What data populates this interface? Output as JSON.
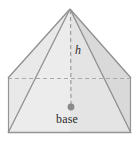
{
  "figure": {
    "kind": "geometry-diagram",
    "canvas": {
      "width": 139,
      "height": 143,
      "background": "#ffffff"
    },
    "labels": {
      "height": "h",
      "base": "base"
    },
    "colors": {
      "outline": "#8f8f8f",
      "hidden_edge": "#a9a9a9",
      "face_front_left": "#ececec",
      "face_front_right": "#e2e2e2",
      "face_right_shaded": "#d8d8d8",
      "base_face": "#ebebeb",
      "center_dot": "#8a8a8a",
      "label_text": "#2b2b2b"
    },
    "points": {
      "apex": {
        "x": 70,
        "y": 9
      },
      "base_back_left": {
        "x": 8,
        "y": 78
      },
      "base_back_right": {
        "x": 131,
        "y": 78
      },
      "base_front_right": {
        "x": 131,
        "y": 133
      },
      "base_front_left": {
        "x": 8,
        "y": 133
      },
      "base_center": {
        "x": 71,
        "y": 107
      }
    },
    "edges": [
      {
        "name": "apex-to-back-left",
        "style": "solid"
      },
      {
        "name": "apex-to-back-right",
        "style": "solid"
      },
      {
        "name": "apex-to-front-left",
        "style": "solid"
      },
      {
        "name": "apex-to-front-right",
        "style": "solid"
      },
      {
        "name": "base-back",
        "style": "dashed"
      },
      {
        "name": "base-left",
        "style": "solid"
      },
      {
        "name": "base-right",
        "style": "solid"
      },
      {
        "name": "base-front",
        "style": "solid"
      },
      {
        "name": "height-segment",
        "style": "dashed"
      }
    ]
  }
}
